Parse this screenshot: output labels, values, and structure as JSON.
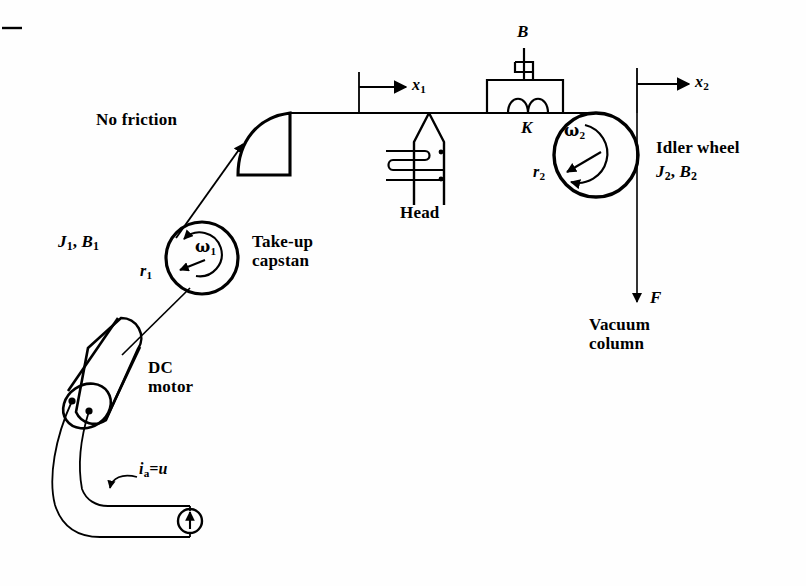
{
  "figure": {
    "type": "mechanical-schematic",
    "background_color": "#fefefe",
    "ink_color": "#000000"
  },
  "labels": {
    "crop_mark": "",
    "no_friction": "No friction",
    "take_up_capstan_line1": "Take-up",
    "take_up_capstan_line2": "capstan",
    "capstan_inertia": "J",
    "capstan_inertia_sub": "1",
    "capstan_damping": "B",
    "capstan_damping_sub": "1",
    "capstan_inertia_full": "J₁, B₁",
    "capstan_radius": "r",
    "capstan_radius_sub": "1",
    "capstan_omega": "ω",
    "capstan_omega_sub": "1",
    "dc_motor_line1": "DC",
    "dc_motor_line2": "motor",
    "armature_current": "i",
    "armature_current_sub": "a",
    "armature_current_eq": "=u",
    "head": "Head",
    "x1": "x",
    "x1_sub": "1",
    "x2": "x",
    "x2_sub": "2",
    "damper_B": "B",
    "spring_K": "K",
    "idler_omega": "ω",
    "idler_omega_sub": "2",
    "idler_radius": "r",
    "idler_radius_sub": "2",
    "idler_wheel": "Idler wheel",
    "idler_inertia": "J",
    "idler_inertia_sub": "2",
    "idler_damping": "B",
    "idler_damping_sub": "2",
    "force_F": "F",
    "vacuum_column_line1": "Vacuum",
    "vacuum_column_line2": "column"
  },
  "components": [
    {
      "name": "dc-motor",
      "kind": "cylinder",
      "label": "DC motor"
    },
    {
      "name": "current-source",
      "kind": "circle-with-up-arrow",
      "label": "i_a = u"
    },
    {
      "name": "take-up-capstan",
      "kind": "wheel",
      "label": "Take-up capstan",
      "inertia": "J₁",
      "damping": "B₁",
      "radius": "r₁",
      "angular_velocity": "ω₁"
    },
    {
      "name": "friction-free-guide",
      "kind": "quarter-round-guide",
      "label": "No friction"
    },
    {
      "name": "tape-head",
      "kind": "read-write-head",
      "label": "Head"
    },
    {
      "name": "damper",
      "kind": "dashpot",
      "label": "B"
    },
    {
      "name": "spring",
      "kind": "coil",
      "label": "K"
    },
    {
      "name": "idler-wheel",
      "kind": "wheel",
      "label": "Idler wheel",
      "inertia": "J₂",
      "damping": "B₂",
      "radius": "r₂",
      "angular_velocity": "ω₂"
    },
    {
      "name": "vacuum-column",
      "kind": "tension-force",
      "label": "Vacuum column",
      "force": "F"
    }
  ],
  "measurements": [
    {
      "name": "x1",
      "label": "x₁",
      "direction": "right",
      "attached_to": "tape-head"
    },
    {
      "name": "x2",
      "label": "x₂",
      "direction": "right",
      "attached_to": "idler-wheel"
    },
    {
      "name": "F",
      "label": "F",
      "direction": "down",
      "attached_to": "vacuum-column"
    }
  ]
}
